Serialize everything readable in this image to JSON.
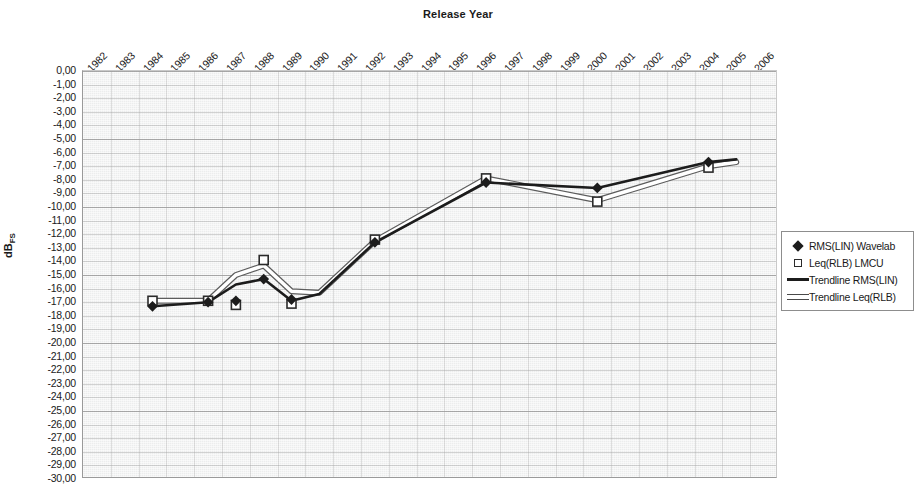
{
  "chart_data": {
    "type": "line",
    "title": "Release Year",
    "xlabel": "",
    "ylabel": "dBFS",
    "ylabel_base": "dB",
    "ylabel_sub": "FS",
    "grid": true,
    "legend_position": "right",
    "ylim": [
      -30,
      0
    ],
    "ytick_step": 1,
    "categories": [
      "1982",
      "1983",
      "1984",
      "1985",
      "1986",
      "1987",
      "1988",
      "1989",
      "1990",
      "1991",
      "1992",
      "1993",
      "1994",
      "1995",
      "1996",
      "1997",
      "1998",
      "1999",
      "2000",
      "2001",
      "2002",
      "2003",
      "2004",
      "2005",
      "2006"
    ],
    "yticks": [
      "0,00",
      "-1,00",
      "-2,00",
      "-3,00",
      "-4,00",
      "-5,00",
      "-6,00",
      "-7,00",
      "-8,00",
      "-9,00",
      "-10,00",
      "-11,00",
      "-12,00",
      "-13,00",
      "-14,00",
      "-15,00",
      "-16,00",
      "-17,00",
      "-18,00",
      "-19,00",
      "-20,00",
      "-21,00",
      "-22,00",
      "-23,00",
      "-24,00",
      "-25,00",
      "-26,00",
      "-27,00",
      "-28,00",
      "-29,00",
      "-30,00"
    ],
    "series": [
      {
        "name": "RMS(LIN) Wavelab",
        "marker": "filled-diamond",
        "color": "#1c1c1c",
        "points": [
          {
            "x": "1984",
            "y": -17.3
          },
          {
            "x": "1986",
            "y": -17.0
          },
          {
            "x": "1987",
            "y": -16.9
          },
          {
            "x": "1988",
            "y": -15.3
          },
          {
            "x": "1989",
            "y": -16.8
          },
          {
            "x": "1992",
            "y": -12.6
          },
          {
            "x": "1996",
            "y": -8.2
          },
          {
            "x": "2000",
            "y": -8.6
          },
          {
            "x": "2004",
            "y": -6.7
          }
        ]
      },
      {
        "name": "Leq(RLB) LMCU",
        "marker": "hollow-square",
        "color": "#2b2b2b",
        "points": [
          {
            "x": "1984",
            "y": -16.9
          },
          {
            "x": "1986",
            "y": -16.9
          },
          {
            "x": "1987",
            "y": -17.2
          },
          {
            "x": "1988",
            "y": -13.9
          },
          {
            "x": "1989",
            "y": -17.1
          },
          {
            "x": "1992",
            "y": -12.4
          },
          {
            "x": "1996",
            "y": -7.9
          },
          {
            "x": "2000",
            "y": -9.6
          },
          {
            "x": "2004",
            "y": -7.1
          }
        ]
      },
      {
        "name": "Trendline RMS(LIN)",
        "style": "solid-black-line",
        "color": "#1c1c1c",
        "values_by_year": [
          {
            "x": "1984",
            "y": -17.3
          },
          {
            "x": "1986",
            "y": -17.0
          },
          {
            "x": "1987",
            "y": -15.7
          },
          {
            "x": "1988",
            "y": -15.3
          },
          {
            "x": "1989",
            "y": -16.9
          },
          {
            "x": "1990",
            "y": -16.4
          },
          {
            "x": "1992",
            "y": -12.6
          },
          {
            "x": "1996",
            "y": -8.2
          },
          {
            "x": "2000",
            "y": -8.6
          },
          {
            "x": "2004",
            "y": -6.7
          },
          {
            "x": "2005",
            "y": -6.5
          }
        ]
      },
      {
        "name": "Trendline Leq(RLB)",
        "style": "hollow-white-line",
        "color": "#ffffff",
        "values_by_year": [
          {
            "x": "1984",
            "y": -16.9
          },
          {
            "x": "1986",
            "y": -16.9
          },
          {
            "x": "1987",
            "y": -15.0
          },
          {
            "x": "1988",
            "y": -14.3
          },
          {
            "x": "1989",
            "y": -16.2
          },
          {
            "x": "1990",
            "y": -16.3
          },
          {
            "x": "1992",
            "y": -12.5
          },
          {
            "x": "1996",
            "y": -7.9
          },
          {
            "x": "2000",
            "y": -9.5
          },
          {
            "x": "2004",
            "y": -7.0
          },
          {
            "x": "2005",
            "y": -6.7
          }
        ]
      }
    ]
  },
  "legend": {
    "items": [
      {
        "label": "RMS(LIN) Wavelab",
        "key": "filled-diamond"
      },
      {
        "label": "Leq(RLB) LMCU",
        "key": "hollow-square"
      },
      {
        "label": "Trendline RMS(LIN)",
        "key": "solid-line"
      },
      {
        "label": "Trendline Leq(RLB)",
        "key": "hollow-line"
      }
    ]
  }
}
